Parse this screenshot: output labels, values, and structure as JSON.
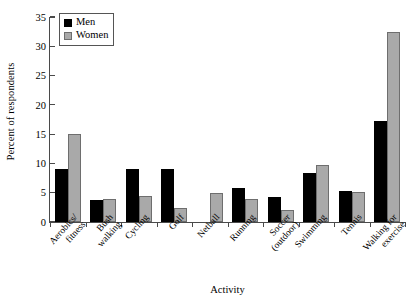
{
  "chart_data": {
    "type": "bar",
    "title": "",
    "xlabel": "Activity",
    "ylabel": "Percent of respondents",
    "ylim": [
      0,
      35
    ],
    "yticks": [
      0,
      5,
      10,
      15,
      20,
      25,
      30,
      35
    ],
    "grid": false,
    "legend_position": "top-left",
    "categories": [
      "Aerobics/ fitness",
      "Bush walking",
      "Cycling",
      "Golf",
      "Netball",
      "Running",
      "Soccer (outdoor)",
      "Swimming",
      "Tennis",
      "Walking for exercise"
    ],
    "category_lines": [
      [
        "Aerobics/",
        "fitness"
      ],
      [
        "Bush",
        "walking"
      ],
      [
        "Cycling",
        ""
      ],
      [
        "Golf",
        ""
      ],
      [
        "Netball",
        ""
      ],
      [
        "Running",
        ""
      ],
      [
        "Soccer",
        "(outdoor)"
      ],
      [
        "Swimming",
        ""
      ],
      [
        "Tennis",
        ""
      ],
      [
        "Walking for",
        "exercise"
      ]
    ],
    "series": [
      {
        "name": "Men",
        "color": "#000000",
        "values": [
          9.0,
          3.7,
          9.0,
          9.0,
          0,
          5.8,
          4.2,
          8.3,
          5.3,
          17.2
        ]
      },
      {
        "name": "Women",
        "color": "#a9a9a9",
        "values": [
          15.0,
          4.0,
          4.4,
          2.4,
          5.0,
          3.9,
          2.0,
          9.8,
          5.2,
          32.5
        ]
      }
    ]
  },
  "legend": {
    "items": [
      {
        "label": "Men"
      },
      {
        "label": "Women"
      }
    ]
  },
  "axis": {
    "y_title": "Percent of respondents",
    "x_title": "Activity",
    "y_tick_labels": [
      "35",
      "30",
      "25",
      "20",
      "15",
      "10",
      "5",
      "0"
    ]
  }
}
